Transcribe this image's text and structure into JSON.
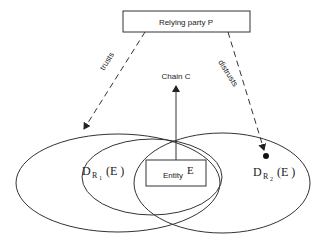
{
  "diagram": {
    "relying_party_label": "Relying party P",
    "trusts_label": "trusts",
    "distrusts_label": "distrusts",
    "chain_label": "Chain C",
    "entity_label": "Entity",
    "entity_symbol": "E",
    "domain1": {
      "base": "D",
      "sub": "R",
      "subsub": "1",
      "arg": "(E )"
    },
    "domain2": {
      "base": "D",
      "sub": "R",
      "subsub": "2",
      "arg": "(E )"
    },
    "colors": {
      "stroke": "#333333",
      "background": "#ffffff"
    }
  }
}
